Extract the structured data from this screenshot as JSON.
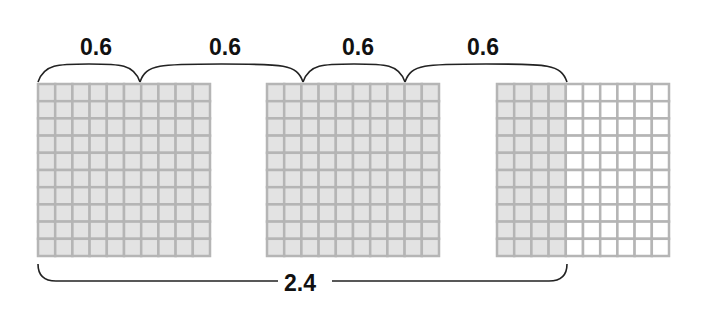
{
  "colors": {
    "shaded": "#e3e3e3",
    "unshaded": "#ffffff",
    "grid_line": "#b5b5b5",
    "bracket": "#222222",
    "text": "#111111"
  },
  "grids": [
    {
      "id": "grid-1",
      "x": 38,
      "y": 84,
      "size": 172,
      "divisions": 10,
      "shaded_columns": 10
    },
    {
      "id": "grid-2",
      "x": 267,
      "y": 84,
      "size": 172,
      "divisions": 10,
      "shaded_columns": 10
    },
    {
      "id": "grid-3",
      "x": 497,
      "y": 84,
      "size": 172,
      "divisions": 10,
      "shaded_columns": 4
    }
  ],
  "top_braces": [
    {
      "label": "0.6",
      "x1": 38,
      "x2": 140,
      "label_x": 96
    },
    {
      "label": "0.6",
      "x1": 140,
      "x2": 303,
      "label_x": 225
    },
    {
      "label": "0.6",
      "x1": 303,
      "x2": 405,
      "label_x": 358
    },
    {
      "label": "0.6",
      "x1": 405,
      "x2": 567,
      "label_x": 483
    }
  ],
  "bottom_brace": {
    "label": "2.4",
    "x1": 38,
    "x2": 567,
    "label_x": 300
  },
  "chart_data": {
    "type": "diagram",
    "addends": [
      0.6,
      0.6,
      0.6,
      0.6
    ],
    "total": 2.4,
    "grid_shading": [
      1.0,
      1.0,
      0.4
    ]
  }
}
